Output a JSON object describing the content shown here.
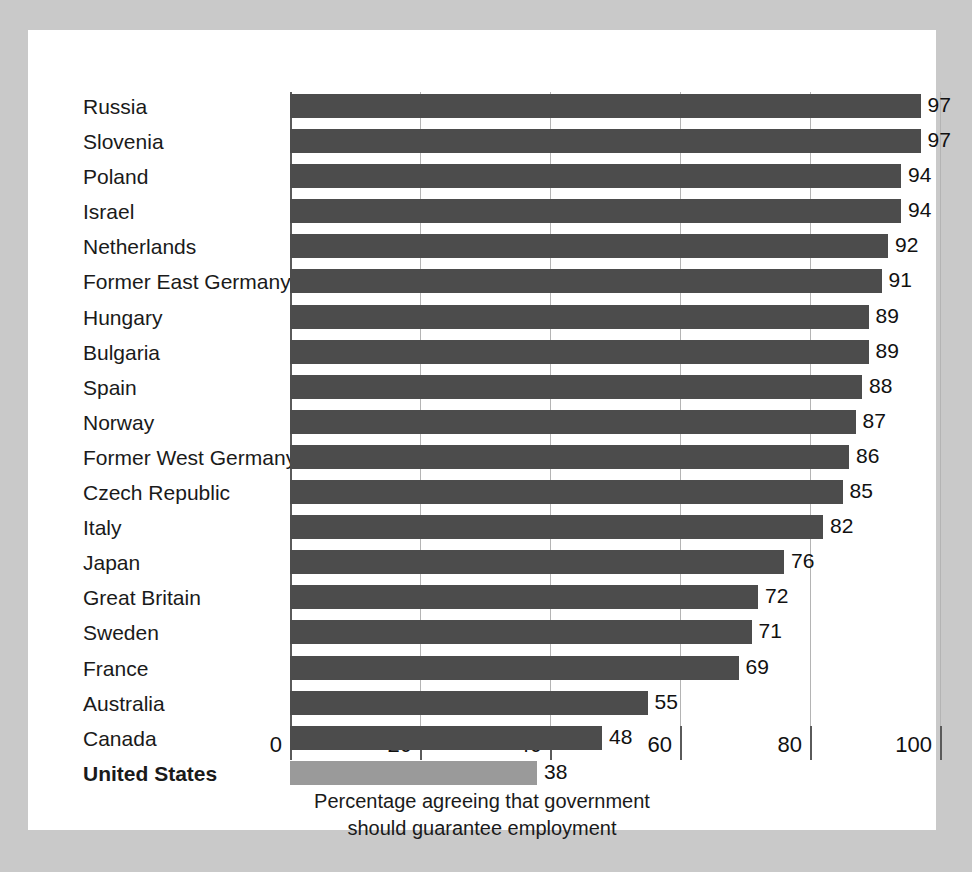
{
  "chart_data": {
    "type": "bar",
    "orientation": "horizontal",
    "title": "",
    "xlabel": "Percentage agreeing that government should guarantee employment",
    "ylabel": "",
    "xlim": [
      0,
      100
    ],
    "xticks": [
      0,
      20,
      40,
      60,
      80,
      100
    ],
    "xtick_labels": [
      "0",
      "20",
      "40",
      "60",
      "80",
      "100"
    ],
    "grid": true,
    "legend": "none",
    "categories": [
      "Russia",
      "Slovenia",
      "Poland",
      "Israel",
      "Netherlands",
      "Former East Germany",
      "Hungary",
      "Bulgaria",
      "Spain",
      "Norway",
      "Former West Germany",
      "Czech Republic",
      "Italy",
      "Japan",
      "Great Britain",
      "Sweden",
      "France",
      "Australia",
      "Canada",
      "United States"
    ],
    "values": [
      97,
      97,
      94,
      94,
      92,
      91,
      89,
      89,
      88,
      87,
      86,
      85,
      82,
      76,
      72,
      71,
      69,
      55,
      48,
      38
    ],
    "value_labels": [
      "97",
      "97",
      "94",
      "94",
      "92",
      "91",
      "89",
      "89",
      "88",
      "87",
      "86",
      "85",
      "82",
      "76",
      "72",
      "71",
      "69",
      "55",
      "48",
      "38"
    ],
    "highlighted_category": "United States",
    "colors": {
      "bar": "#4c4c4c",
      "bar_highlight": "#9a9a9a",
      "axis": "#5a5a5a",
      "grid": "#b4b4b4",
      "panel_background": "#ffffff",
      "figure_background": "#c9c9c9",
      "text": "#1a1a1a"
    }
  },
  "caption": {
    "line1": "Percentage agreeing that government",
    "line2": "should guarantee employment"
  }
}
